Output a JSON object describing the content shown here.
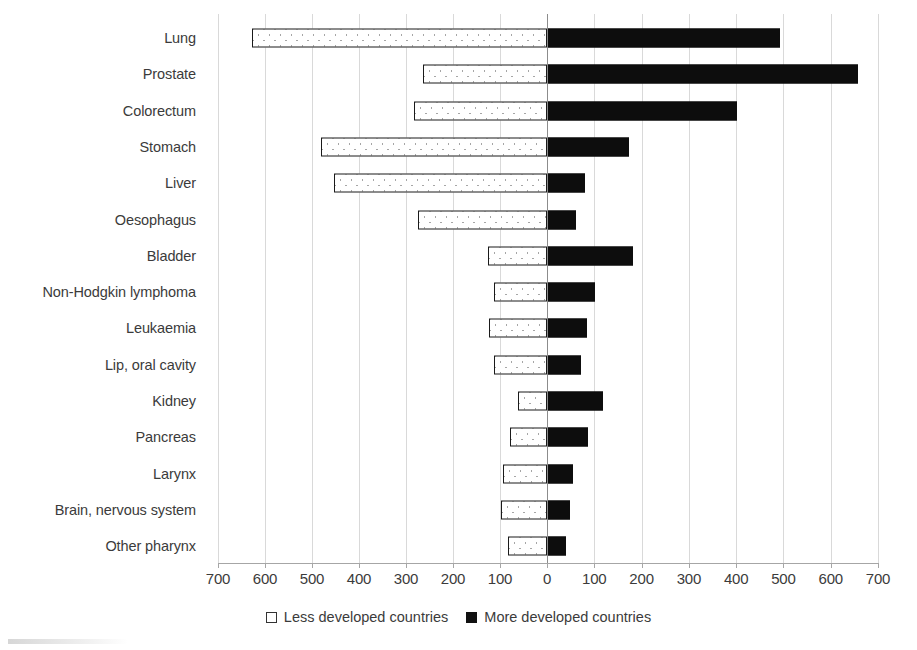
{
  "chart_data": {
    "type": "bar",
    "orientation": "horizontal",
    "subtype": "diverging-bidirectional",
    "title": "",
    "subtitle": "",
    "xlabel": "",
    "ylabel": "",
    "grid": true,
    "legend_position": "bottom-center",
    "xlim": [
      -700,
      700
    ],
    "axis_ticks": [
      {
        "label": "700",
        "value": -700
      },
      {
        "label": "600",
        "value": -600
      },
      {
        "label": "500",
        "value": -500
      },
      {
        "label": "400",
        "value": -400
      },
      {
        "label": "300",
        "value": -300
      },
      {
        "label": "200",
        "value": -200
      },
      {
        "label": "100",
        "value": -100
      },
      {
        "label": "0",
        "value": 0
      },
      {
        "label": "100",
        "value": 100
      },
      {
        "label": "200",
        "value": 200
      },
      {
        "label": "300",
        "value": 300
      },
      {
        "label": "400",
        "value": 400
      },
      {
        "label": "500",
        "value": 500
      },
      {
        "label": "600",
        "value": 600
      },
      {
        "label": "700",
        "value": 700
      }
    ],
    "categories": [
      "Lung",
      "Prostate",
      "Colorectum",
      "Stomach",
      "Liver",
      "Oesophagus",
      "Bladder",
      "Non-Hodgkin lymphoma",
      "Leukaemia",
      "Lip, oral cavity",
      "Kidney",
      "Pancreas",
      "Larynx",
      "Brain, nervous system",
      "Other pharynx"
    ],
    "series": [
      {
        "name": "Less developed countries",
        "direction": "left",
        "color": "#ffffff",
        "pattern": "dotted-outline",
        "values": [
          628,
          264,
          283,
          480,
          453,
          275,
          125,
          112,
          123,
          112,
          61,
          78,
          93,
          97,
          82
        ]
      },
      {
        "name": "More developed countries",
        "direction": "right",
        "color": "#0d0d0d",
        "pattern": "solid-fill",
        "values": [
          492,
          658,
          402,
          174,
          81,
          62,
          182,
          101,
          85,
          72,
          118,
          87,
          55,
          49,
          40
        ]
      }
    ]
  },
  "legend": {
    "entries": [
      {
        "marker": "empty-square-icon",
        "label": "Less developed countries"
      },
      {
        "marker": "filled-square-icon",
        "label": "More developed countries"
      }
    ]
  }
}
